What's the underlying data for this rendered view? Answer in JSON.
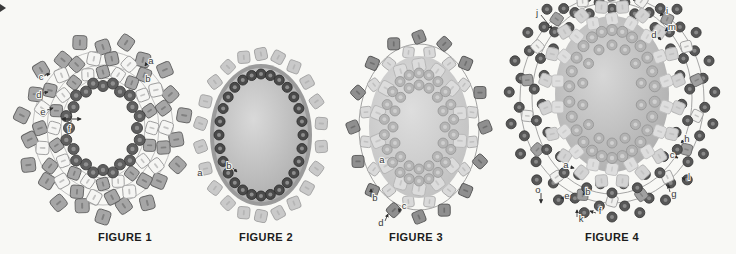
{
  "figures": [
    {
      "id": "figure-1",
      "caption": "FIGURE 1",
      "cx": 103,
      "cy": 128,
      "rings": [
        {
          "shape": "thread",
          "rx": 70,
          "ry": 77,
          "color": "#b2b2b2"
        },
        {
          "shape": "thread",
          "rx": 56,
          "ry": 63,
          "color": "#b2b2b2"
        },
        {
          "shape": "thread",
          "rx": 42,
          "ry": 50,
          "color": "#b2b2b2"
        },
        {
          "shape": "square",
          "count": 22,
          "rx": 78,
          "ry": 85,
          "size": 14,
          "fill": "#a6a6a6",
          "stroke": "#636363",
          "tilt": 18,
          "jitter": 4
        },
        {
          "shape": "square",
          "count": 22,
          "rx": 63,
          "ry": 70,
          "size": 13,
          "fill": "#a6a6a6",
          "stroke": "#636363",
          "alt_fill": "#f5f5f3",
          "alt_stroke": "#9b9b9b",
          "tilt": 20,
          "phase": 0.14
        },
        {
          "shape": "square",
          "count": 20,
          "rx": 49,
          "ry": 56,
          "size": 12,
          "fill": "#a6a6a6",
          "stroke": "#636363",
          "alt_fill": "#f5f5f3",
          "alt_stroke": "#9b9b9b",
          "tilt": 16
        },
        {
          "shape": "circle",
          "count": 24,
          "rx": 36,
          "ry": 44,
          "r": 5.5,
          "fill": "#5f5f5f",
          "stroke": "#3e3e3e",
          "hole": "#8f8f8f",
          "jitter": 2
        }
      ],
      "labels": [
        {
          "t": "a",
          "x": 151,
          "y": 59,
          "ax": 145,
          "ay": 66
        },
        {
          "t": "b",
          "x": 148,
          "y": 77
        },
        {
          "t": "c",
          "x": 41,
          "y": 75,
          "ax": 50,
          "ay": 74
        },
        {
          "t": "d",
          "x": 39,
          "y": 93,
          "ax": 48,
          "ay": 92
        },
        {
          "t": "e",
          "x": 43,
          "y": 110,
          "ax": 53,
          "ay": 108
        },
        {
          "t": "f",
          "x": 69,
          "y": 127
        }
      ],
      "lines": [
        {
          "x1": 62,
          "y1": 119,
          "x2": 81,
          "y2": 119,
          "arrow": "both"
        },
        {
          "x1": 71,
          "y1": 112,
          "x2": 71,
          "y2": 131,
          "dash": "2,2"
        }
      ]
    },
    {
      "id": "figure-2",
      "caption": "FIGURE 2",
      "cx": 261,
      "cy": 135,
      "rings": [
        {
          "shape": "square",
          "count": 22,
          "rx": 61,
          "ry": 81,
          "size": 12,
          "fill": "#c9c9c9",
          "stroke": "#a4a4a4",
          "tilt": 12
        },
        {
          "shape": "band",
          "rx": 51,
          "ry": 71,
          "color": "#9b9b9b"
        },
        {
          "shape": "cabochon",
          "rx": 47,
          "ry": 67,
          "inner": "#d9d9d9",
          "outer": "#a6a6a6"
        },
        {
          "shape": "circle",
          "count": 28,
          "rx": 42,
          "ry": 61,
          "r": 5,
          "fill": "#4a4a4a",
          "stroke": "#2f2f2f",
          "hole": "#8d8d8d"
        }
      ],
      "labels": [
        {
          "t": "a",
          "x": 200,
          "y": 171
        },
        {
          "t": "b",
          "x": 229,
          "y": 164,
          "ax": 237,
          "ay": 172
        }
      ],
      "lines": []
    },
    {
      "id": "figure-3",
      "caption": "FIGURE 3",
      "cx": 419,
      "cy": 127,
      "rings": [
        {
          "shape": "thread",
          "rx": 60,
          "ry": 83,
          "color": "#8a8a8a"
        },
        {
          "shape": "square",
          "count": 16,
          "rx": 66,
          "ry": 90,
          "size": 12,
          "fill": "#8f8f8f",
          "stroke": "#575757",
          "tilt": 22
        },
        {
          "shape": "square",
          "count": 16,
          "rx": 54,
          "ry": 76,
          "size": 11,
          "fill": "#d9d9d9",
          "stroke": "#ababab",
          "tilt": 18,
          "phase": 0.197
        },
        {
          "shape": "cabochon",
          "rx": 50,
          "ry": 71,
          "inner": "#dedede",
          "outer": "#bdbdbd"
        },
        {
          "shape": "square",
          "count": 14,
          "rx": 42,
          "ry": 62,
          "size": 13,
          "fill": "#dcdcdc",
          "stroke": "#b6b6b6",
          "tilt": 10
        },
        {
          "shape": "circle",
          "count": 22,
          "rx": 35,
          "ry": 54,
          "r": 5,
          "fill": "#b5b5b5",
          "stroke": "#989898",
          "hole": "#cfcfcf"
        },
        {
          "shape": "circle",
          "count": 16,
          "rx": 26,
          "ry": 42,
          "r": 5,
          "fill": "#b5b5b5",
          "stroke": "#989898",
          "hole": "#cfcfcf"
        }
      ],
      "labels": [
        {
          "t": "a",
          "x": 382,
          "y": 158
        },
        {
          "t": "b",
          "x": 375,
          "y": 196,
          "ax": 371,
          "ay": 189
        },
        {
          "t": "c",
          "x": 404,
          "y": 204,
          "ax": 399,
          "ay": 212
        },
        {
          "t": "d",
          "x": 381,
          "y": 221,
          "ax": 388,
          "ay": 214
        }
      ],
      "lines": []
    },
    {
      "id": "figure-4",
      "caption": "FIGURE 4",
      "cx": 612,
      "cy": 94,
      "rings": [
        {
          "shape": "thread",
          "rx": 92,
          "ry": 104,
          "dy": 5,
          "color": "#8f8f8f"
        },
        {
          "shape": "thread",
          "rx": 80,
          "ry": 96,
          "dy": 4,
          "color": "#8f8f8f"
        },
        {
          "shape": "circle",
          "count": 46,
          "rx": 98,
          "ry": 112,
          "dy": 6,
          "r": 5,
          "fill": "#575757",
          "stroke": "#393939",
          "hole": "#898989",
          "jitter": 5
        },
        {
          "shape": "square",
          "count": 18,
          "rx": 86,
          "ry": 103,
          "dy": 4,
          "size": 11,
          "fill": "#a0a0a0",
          "stroke": "#6d6d6d",
          "alt_fill": "#f0f0ee",
          "alt_stroke": "#a0a0a0",
          "tilt": 16
        },
        {
          "shape": "circle",
          "count": 38,
          "rx": 74,
          "ry": 92,
          "dy": 3,
          "r": 5,
          "fill": "#575757",
          "stroke": "#393939",
          "hole": "#898989",
          "jitter": 4
        },
        {
          "shape": "square",
          "count": 20,
          "rx": 67,
          "ry": 88,
          "size": 12,
          "fill": "#d3d3d3",
          "stroke": "#b5b5b5",
          "tilt": 14,
          "phase": 0.157
        },
        {
          "shape": "cabochon",
          "rx": 57,
          "ry": 78,
          "inner": "#d7d7d7",
          "outer": "#a9a9a9"
        },
        {
          "shape": "square",
          "count": 18,
          "rx": 55,
          "ry": 75,
          "size": 12,
          "fill": "#dedede",
          "stroke": "#bfbfbf",
          "tilt": 10
        },
        {
          "shape": "circle",
          "count": 26,
          "rx": 43,
          "ry": 64,
          "r": 5.5,
          "fill": "#b3b3b3",
          "stroke": "#969696",
          "hole": "#d0d0d0"
        },
        {
          "shape": "circle",
          "count": 14,
          "rx": 30,
          "ry": 49,
          "r": 5,
          "fill": "#b3b3b3",
          "stroke": "#969696",
          "hole": "#d0d0d0"
        }
      ],
      "labels": [
        {
          "t": "j",
          "x": 537,
          "y": 11,
          "ax": 552,
          "ay": 29
        },
        {
          "t": "i",
          "x": 667,
          "y": 9,
          "ax": 660,
          "ay": 16
        },
        {
          "t": "m",
          "x": 672,
          "y": 25,
          "ax": 665,
          "ay": 31
        },
        {
          "t": "d",
          "x": 654,
          "y": 33,
          "ax": 661,
          "ay": 40
        },
        {
          "t": "h",
          "x": 687,
          "y": 137,
          "ax": 681,
          "ay": 143
        },
        {
          "t": "c",
          "x": 672,
          "y": 153,
          "ax": 678,
          "ay": 158
        },
        {
          "t": "l",
          "x": 689,
          "y": 175,
          "ax": 682,
          "ay": 178
        },
        {
          "t": "g",
          "x": 674,
          "y": 192,
          "ax": 668,
          "ay": 185
        },
        {
          "t": "a",
          "x": 566,
          "y": 163,
          "ax": 574,
          "ay": 168
        },
        {
          "t": "o",
          "x": 538,
          "y": 188
        },
        {
          "t": "e",
          "x": 567,
          "y": 194,
          "ax": 561,
          "ay": 198
        },
        {
          "t": "b",
          "x": 588,
          "y": 190,
          "ax": 583,
          "ay": 195
        },
        {
          "t": "k",
          "x": 581,
          "y": 217,
          "ax": 577,
          "ay": 210
        },
        {
          "t": "f",
          "x": 600,
          "y": 209,
          "ax": 590,
          "ay": 211
        }
      ],
      "lines": [
        {
          "x1": 541,
          "y1": 193,
          "x2": 541,
          "y2": 203,
          "arrow": "end"
        }
      ]
    }
  ]
}
